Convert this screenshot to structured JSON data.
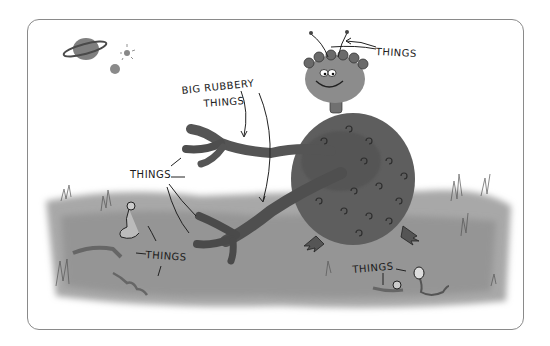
{
  "illustration": {
    "style": "grayscale watercolor cartoon",
    "labels": {
      "big_rubbery": "BIG RUBBERY",
      "big_rubbery_line2": "THINGS",
      "antennae": "THINGS",
      "fingers": "THINGS",
      "worms_left": "THINGS",
      "worms_right": "THINGS"
    },
    "colors": {
      "frame_border": "#8a8a8a",
      "grass": "#9a9a9a",
      "creature_body": "#5e5e5e",
      "creature_head": "#8c8c8c",
      "ink": "#1a1a1a"
    }
  }
}
